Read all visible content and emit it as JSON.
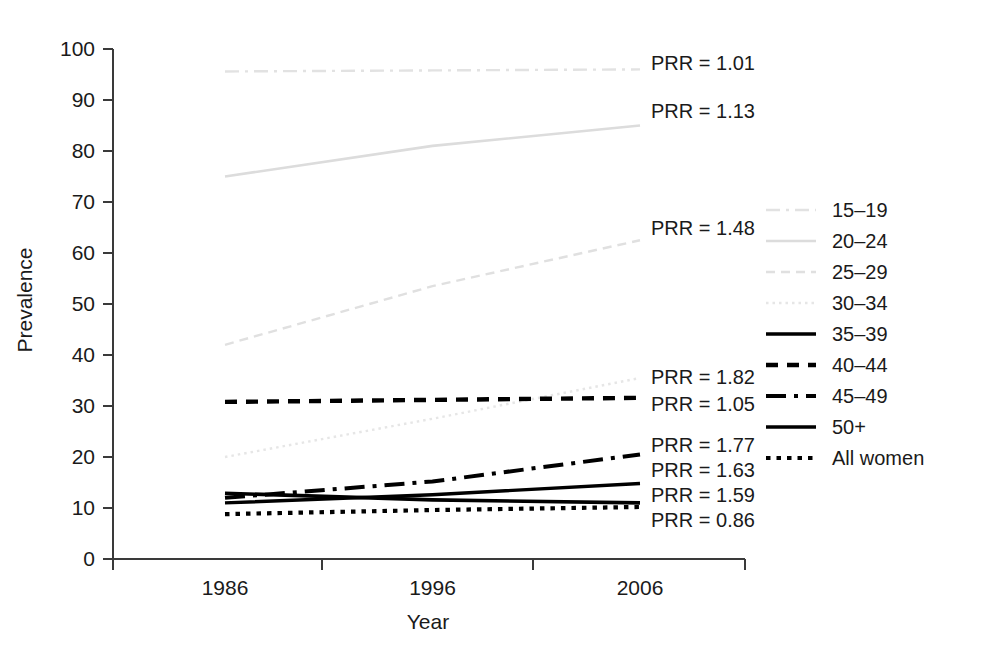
{
  "chart_data": {
    "type": "line",
    "title": "",
    "xlabel": "Year",
    "ylabel": "Prevalence",
    "x": [
      1986,
      1996,
      2006
    ],
    "xticklabels": [
      "1986",
      "1996",
      "2006"
    ],
    "yticklabels": [
      "0",
      "10",
      "20",
      "30",
      "40",
      "50",
      "60",
      "70",
      "80",
      "90",
      "100"
    ],
    "ylim": [
      0,
      100
    ],
    "ytick_step": 10,
    "grid": false,
    "legend_position": "right",
    "series": [
      {
        "name": "15–19",
        "values": [
          95.6,
          95.8,
          96.0
        ],
        "style": "dashdot",
        "color": "#e2e2e2",
        "width": 2.4,
        "prr": "PRR = 1.01"
      },
      {
        "name": "20–24",
        "values": [
          75.0,
          81.0,
          85.0
        ],
        "style": "solid",
        "color": "#dcdcdc",
        "width": 2.6,
        "prr": "PRR = 1.13"
      },
      {
        "name": "25–29",
        "values": [
          42.0,
          53.5,
          62.5
        ],
        "style": "dashed",
        "color": "#e0e0e0",
        "width": 2.4,
        "prr": "PRR = 1.48"
      },
      {
        "name": "30–34",
        "values": [
          20.0,
          27.5,
          35.5
        ],
        "style": "dotted",
        "color": "#e6e6e6",
        "width": 2.4,
        "prr": "PRR = 1.82"
      },
      {
        "name": "35–39",
        "values": [
          12.9,
          11.6,
          11.0
        ],
        "style": "solid",
        "color": "#000000",
        "width": 3.6,
        "prr": "PRR = 1.77"
      },
      {
        "name": "40–44",
        "values": [
          30.8,
          31.2,
          31.6
        ],
        "style": "dashed-thick",
        "color": "#000000",
        "width": 4.4,
        "prr": "PRR = 1.05"
      },
      {
        "name": "45–49",
        "values": [
          12.0,
          15.2,
          20.5
        ],
        "style": "dashdot-thick",
        "color": "#000000",
        "width": 4.0,
        "prr": "PRR = 1.63"
      },
      {
        "name": "50+",
        "values": [
          11.0,
          12.6,
          14.8
        ],
        "style": "solid",
        "color": "#000000",
        "width": 3.4,
        "prr": "PRR = 1.59"
      },
      {
        "name": "All women",
        "values": [
          8.8,
          9.6,
          10.2
        ],
        "style": "dotted-thick",
        "color": "#000000",
        "width": 4.2,
        "prr": "PRR = 0.86"
      }
    ],
    "prr_annotations": [
      "PRR = 1.01",
      "PRR = 1.13",
      "PRR = 1.48",
      "PRR = 1.82",
      "PRR = 1.05",
      "PRR = 1.77",
      "PRR = 1.63",
      "PRR = 1.59",
      "PRR = 0.86"
    ]
  },
  "legend": {
    "items": [
      {
        "label": "15–19"
      },
      {
        "label": "20–24"
      },
      {
        "label": "25–29"
      },
      {
        "label": "30–34"
      },
      {
        "label": "35–39"
      },
      {
        "label": "40–44"
      },
      {
        "label": "45–49"
      },
      {
        "label": "50+"
      },
      {
        "label": "All women"
      }
    ]
  },
  "axes": {
    "y_title": "Prevalence",
    "x_title": "Year",
    "y_ticks": [
      "100",
      "90",
      "80",
      "70",
      "60",
      "50",
      "40",
      "30",
      "20",
      "10",
      "0"
    ],
    "x_ticks": [
      "1986",
      "1996",
      "2006"
    ]
  },
  "annotations_layout": {
    "prr_rows": [
      {
        "text": "PRR = 1.01",
        "y": 70
      },
      {
        "text": "PRR = 1.13",
        "y": 118
      },
      {
        "text": "PRR = 1.48",
        "y": 235
      },
      {
        "text": "PRR = 1.82",
        "y": 384
      },
      {
        "text": "PRR = 1.05",
        "y": 411
      },
      {
        "text": "PRR = 1.77",
        "y": 452
      },
      {
        "text": "PRR = 1.63",
        "y": 477
      },
      {
        "text": "PRR = 1.59",
        "y": 502
      },
      {
        "text": "PRR = 0.86",
        "y": 527
      }
    ]
  }
}
